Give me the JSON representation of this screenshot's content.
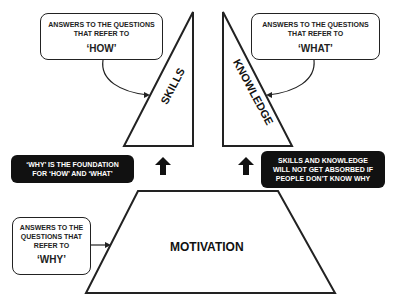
{
  "callouts": {
    "how": {
      "line1": "ANSWERS TO THE QUESTIONS",
      "line2": "THAT REFER TO",
      "keyword": "‘HOW’"
    },
    "what": {
      "line1": "ANSWERS TO THE QUESTIONS",
      "line2": "THAT REFER TO",
      "keyword": "‘WHAT’"
    },
    "why": {
      "line1": "ANSWERS TO THE",
      "line2": "QUESTIONS THAT",
      "line3": "REFER TO",
      "keyword": "‘WHY’"
    }
  },
  "shapes": {
    "skills": "SKILLS",
    "knowledge": "KNOWLEDGE",
    "motivation": "MOTIVATION"
  },
  "notes": {
    "foundation": {
      "line1": "‘WHY’ IS THE FOUNDATION",
      "line2": "FOR ‘HOW’ AND ‘WHAT’"
    },
    "absorption": {
      "line1": "SKILLS AND KNOWLEDGE",
      "line2": "WILL NOT GET ABSORBED IF",
      "line3": "PEOPLE DON’T KNOW WHY"
    }
  },
  "colors": {
    "stroke": "#222222",
    "dark_box": "#111111",
    "text_light": "#ffffff"
  }
}
